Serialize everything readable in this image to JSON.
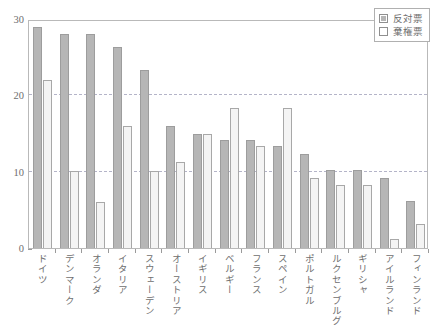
{
  "chart_data": {
    "type": "bar",
    "title": "",
    "subtitle": "",
    "xlabel": "",
    "ylabel": "",
    "ylim": [
      0,
      30
    ],
    "yticks": [
      0,
      10,
      20,
      30
    ],
    "ytick_labels": [
      "0",
      "10",
      "20",
      "30"
    ],
    "grid": true,
    "gridlines_at": [
      10,
      20
    ],
    "legend_position": "top-right",
    "categories": [
      "ドイツ",
      "デンマーク",
      "オランダ",
      "イタリア",
      "スウェーデン",
      "オーストリア",
      "イギリス",
      "ベルギー",
      "フランス",
      "スペイン",
      "ポルトガル",
      "ルクセンブルグ",
      "ギリシャ",
      "アイルランド",
      "フィンランド"
    ],
    "series": [
      {
        "name": "反対票",
        "color": "#b6b6b6",
        "values": [
          29.0,
          28.0,
          28.0,
          26.3,
          23.3,
          16.0,
          15.0,
          14.2,
          14.2,
          13.3,
          12.3,
          10.2,
          10.2,
          9.2,
          6.2
        ]
      },
      {
        "name": "棄権票",
        "color": "#f4f4f4",
        "values": [
          22.0,
          10.1,
          6.0,
          16.0,
          10.1,
          11.3,
          15.0,
          18.3,
          13.3,
          18.3,
          9.2,
          8.2,
          8.2,
          1.2,
          3.2
        ]
      }
    ]
  },
  "legend": {
    "items": [
      {
        "label": "反対票",
        "swatch": "opp"
      },
      {
        "label": "棄権票",
        "swatch": "abs"
      }
    ]
  },
  "caption": {
    "text": ""
  }
}
